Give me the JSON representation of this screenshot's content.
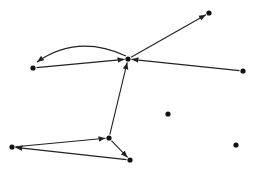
{
  "diagram": {
    "type": "directed-graph",
    "colors": {
      "node": "#111111",
      "edge": "#222222",
      "background": "#ffffff"
    },
    "nodes": [
      {
        "id": "A",
        "x": 33,
        "y": 68
      },
      {
        "id": "B",
        "x": 128,
        "y": 59
      },
      {
        "id": "C",
        "x": 209,
        "y": 13
      },
      {
        "id": "D",
        "x": 243,
        "y": 71
      },
      {
        "id": "E",
        "x": 168,
        "y": 114
      },
      {
        "id": "F",
        "x": 109,
        "y": 138
      },
      {
        "id": "G",
        "x": 12,
        "y": 147
      },
      {
        "id": "H",
        "x": 130,
        "y": 160
      },
      {
        "id": "I",
        "x": 236,
        "y": 145
      }
    ],
    "edges": [
      {
        "from": "A",
        "to": "B",
        "curved": false
      },
      {
        "from": "B",
        "to": "A",
        "curved": true
      },
      {
        "from": "B",
        "to": "C",
        "curved": false
      },
      {
        "from": "D",
        "to": "B",
        "curved": false
      },
      {
        "from": "F",
        "to": "B",
        "curved": false
      },
      {
        "from": "G",
        "to": "F",
        "curved": false
      },
      {
        "from": "F",
        "to": "H",
        "curved": false
      },
      {
        "from": "H",
        "to": "G",
        "curved": false
      }
    ]
  }
}
